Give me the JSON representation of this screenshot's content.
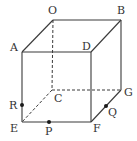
{
  "figure": {
    "type": "cube",
    "vertices": {
      "O": {
        "label": "O",
        "x": 53,
        "y": 20,
        "lx": 48,
        "ly": 14
      },
      "B": {
        "label": "B",
        "x": 121,
        "y": 20,
        "lx": 117,
        "ly": 14
      },
      "A": {
        "label": "A",
        "x": 22,
        "y": 52,
        "lx": 10,
        "ly": 51
      },
      "D": {
        "label": "D",
        "x": 91,
        "y": 52,
        "lx": 82,
        "ly": 50
      },
      "C": {
        "label": "C",
        "x": 52,
        "y": 90,
        "lx": 54,
        "ly": 102
      },
      "G": {
        "label": "G",
        "x": 121,
        "y": 90,
        "lx": 124,
        "ly": 96
      },
      "E": {
        "label": "E",
        "x": 22,
        "y": 122,
        "lx": 10,
        "ly": 132
      },
      "F": {
        "label": "F",
        "x": 91,
        "y": 122,
        "lx": 93,
        "ly": 132
      }
    },
    "points": {
      "R": {
        "label": "R",
        "x": 22,
        "y": 105,
        "lx": 9,
        "ly": 109,
        "on_edge": "AE"
      },
      "P": {
        "label": "P",
        "x": 49,
        "y": 122,
        "lx": 45,
        "ly": 135,
        "on_edge": "EF"
      },
      "Q": {
        "label": "Q",
        "x": 106,
        "y": 106,
        "lx": 108,
        "ly": 116,
        "on_edge": "FG"
      }
    },
    "visible_edges": [
      "OB",
      "OA",
      "AD",
      "DB",
      "AE",
      "DF",
      "BG",
      "EF",
      "FG"
    ],
    "hidden_edges": [
      "OC",
      "CE",
      "CG"
    ]
  }
}
